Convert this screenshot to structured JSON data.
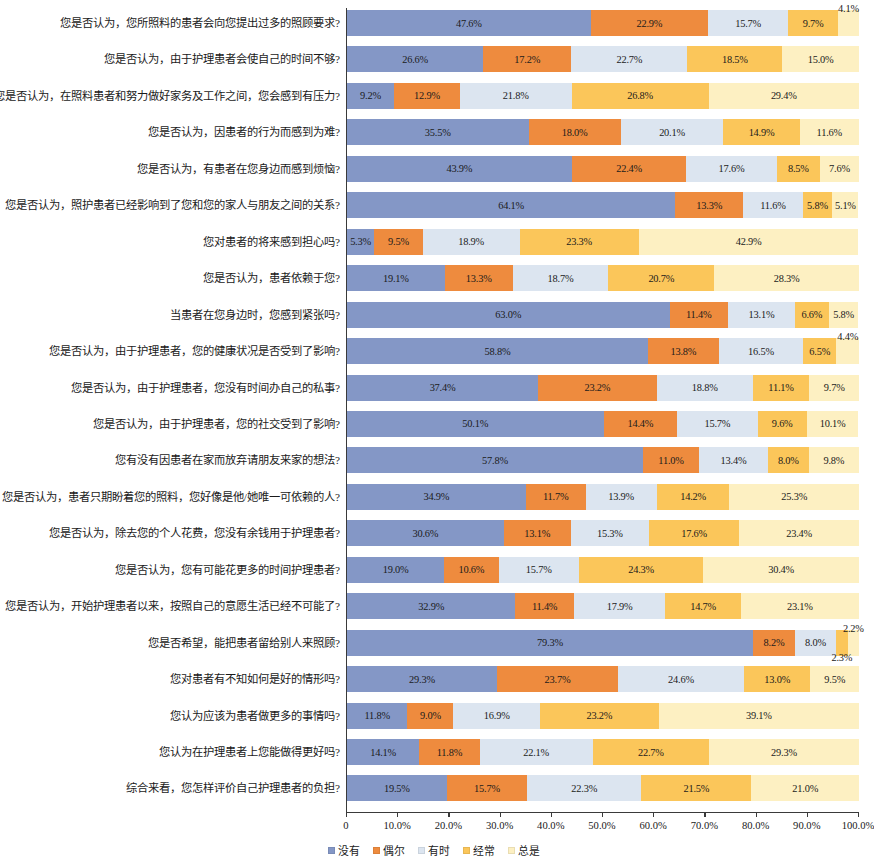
{
  "chart_data": {
    "type": "bar",
    "subtype": "horizontal-stacked-100-percent",
    "title": "",
    "subtitle": "",
    "xlabel": "",
    "ylabel": "",
    "xlim": [
      0,
      100
    ],
    "grid": false,
    "legend_position": "bottom",
    "value_suffix": "%",
    "x_ticks": [
      "0",
      "10.0%",
      "20.0%",
      "30.0%",
      "40.0%",
      "50.0%",
      "60.0%",
      "70.0%",
      "80.0%",
      "90.0%",
      "100.0%"
    ],
    "x_tick_values": [
      0,
      10,
      20,
      30,
      40,
      50,
      60,
      70,
      80,
      90,
      100
    ],
    "series_names": [
      "没有",
      "偶尔",
      "有时",
      "经常",
      "总是"
    ],
    "series_colors": [
      "#8497c6",
      "#ee8b3e",
      "#dce5f0",
      "#fbc65a",
      "#fdf0c2"
    ],
    "categories": [
      "您是否认为，您所照料的患者会向您提出过多的照顾要求?",
      "您是否认为，由于护理患者会使自己的时间不够?",
      "您是否认为，在照料患者和努力做好家务及工作之间，您会感到有压力?",
      "您是否认为，因患者的行为而感到为难?",
      "您是否认为，有患者在您身边而感到烦恼?",
      "您是否认为，照护患者已经影响到了您和您的家人与朋友之间的关系?",
      "您对患者的将来感到担心吗?",
      "您是否认为，患者依赖于您?",
      "当患者在您身边时，您感到紧张吗?",
      "您是否认为，由于护理患者，您的健康状况是否受到了影响?",
      "您是否认为，由于护理患者，您没有时间办自己的私事?",
      "您是否认为，由于护理患者，您的社交受到了影响?",
      "您有没有因患者在家而放弃请朋友来家的想法?",
      "您是否认为，患者只期盼着您的照料，您好像是他/她唯一可依赖的人?",
      "您是否认为，除去您的个人花费，您没有余钱用于护理患者?",
      "您是否认为，您有可能花更多的时间护理患者?",
      "您是否认为，开始护理患者以来，按照自己的意愿生活已经不可能了?",
      "您是否希望，能把患者留给别人来照顾?",
      "您对患者有不知如何是好的情形吗?",
      "您认为应该为患者做更多的事情吗?",
      "您认为在护理患者上您能做得更好吗?",
      "综合来看，您怎样评价自己护理患者的负担?"
    ],
    "series": [
      {
        "name": "没有",
        "color": "#8497c6",
        "values": [
          47.6,
          26.6,
          9.2,
          35.5,
          43.9,
          64.1,
          5.3,
          19.1,
          63.0,
          58.8,
          37.4,
          50.1,
          57.8,
          34.9,
          30.6,
          19.0,
          32.9,
          79.3,
          29.3,
          11.8,
          14.1,
          19.5
        ]
      },
      {
        "name": "偶尔",
        "color": "#ee8b3e",
        "values": [
          22.9,
          17.2,
          12.9,
          18.0,
          22.4,
          13.3,
          9.5,
          13.3,
          11.4,
          13.8,
          23.2,
          14.4,
          11.0,
          11.7,
          13.1,
          10.6,
          11.4,
          8.2,
          23.7,
          9.0,
          11.8,
          15.7
        ]
      },
      {
        "name": "有时",
        "color": "#dce5f0",
        "values": [
          15.7,
          22.7,
          21.8,
          20.1,
          17.6,
          11.6,
          18.9,
          18.7,
          13.1,
          16.5,
          18.8,
          15.7,
          13.4,
          13.9,
          15.3,
          15.7,
          17.9,
          8.0,
          24.6,
          16.9,
          22.1,
          22.3
        ]
      },
      {
        "name": "经常",
        "color": "#fbc65a",
        "values": [
          9.7,
          18.5,
          26.8,
          14.9,
          8.5,
          5.8,
          23.3,
          20.7,
          6.6,
          6.5,
          11.1,
          9.6,
          8.0,
          14.2,
          17.6,
          24.3,
          14.7,
          2.3,
          13.0,
          23.2,
          22.7,
          21.5
        ]
      },
      {
        "name": "总是",
        "color": "#fdf0c2",
        "values": [
          4.1,
          15.0,
          29.4,
          11.6,
          7.6,
          5.1,
          42.9,
          28.3,
          5.8,
          4.4,
          9.7,
          10.1,
          9.8,
          25.3,
          23.4,
          30.4,
          23.1,
          2.2,
          9.5,
          39.1,
          29.3,
          21.0
        ]
      }
    ],
    "data_labels": [
      [
        "47.6%",
        "22.9%",
        "15.7%",
        "9.7%",
        "4.1%"
      ],
      [
        "26.6%",
        "17.2%",
        "22.7%",
        "18.5%",
        "15.0%"
      ],
      [
        "9.2%",
        "12.9%",
        "21.8%",
        "26.8%",
        "29.4%"
      ],
      [
        "35.5%",
        "18.0%",
        "20.1%",
        "14.9%",
        "11.6%"
      ],
      [
        "43.9%",
        "22.4%",
        "17.6%",
        "8.5%",
        "7.6%"
      ],
      [
        "64.1%",
        "13.3%",
        "11.6%",
        "5.8%",
        "5.1%"
      ],
      [
        "5.3%",
        "9.5%",
        "18.9%",
        "23.3%",
        "42.9%"
      ],
      [
        "19.1%",
        "13.3%",
        "18.7%",
        "20.7%",
        "28.3%"
      ],
      [
        "63.0%",
        "11.4%",
        "13.1%",
        "6.6%",
        "5.8%"
      ],
      [
        "58.8%",
        "13.8%",
        "16.5%",
        "6.5%",
        "4.4%"
      ],
      [
        "37.4%",
        "23.2%",
        "18.8%",
        "11.1%",
        "9.7%"
      ],
      [
        "50.1%",
        "14.4%",
        "15.7%",
        "9.6%",
        "10.1%"
      ],
      [
        "57.8%",
        "11.0%",
        "13.4%",
        "8.0%",
        "9.8%"
      ],
      [
        "34.9%",
        "11.7%",
        "13.9%",
        "14.2%",
        "25.3%"
      ],
      [
        "30.6%",
        "13.1%",
        "15.3%",
        "17.6%",
        "23.4%"
      ],
      [
        "19.0%",
        "10.6%",
        "15.7%",
        "24.3%",
        "30.4%"
      ],
      [
        "32.9%",
        "11.4%",
        "17.9%",
        "14.7%",
        "23.1%"
      ],
      [
        "79.3%",
        "8.2%",
        "8.0%",
        "2.3%",
        "2.2%"
      ],
      [
        "29.3%",
        "23.7%",
        "24.6%",
        "13.0%",
        "9.5%"
      ],
      [
        "11.8%",
        "9.0%",
        "16.9%",
        "23.2%",
        "39.1%"
      ],
      [
        "14.1%",
        "11.8%",
        "22.1%",
        "22.7%",
        "29.3%"
      ],
      [
        "19.5%",
        "15.7%",
        "22.3%",
        "21.5%",
        "21.0%"
      ]
    ]
  },
  "legend": {
    "items": [
      {
        "label": "没有",
        "color": "#8497c6"
      },
      {
        "label": "偶尔",
        "color": "#ee8b3e"
      },
      {
        "label": "有时",
        "color": "#dce5f0"
      },
      {
        "label": "经常",
        "color": "#fbc65a"
      },
      {
        "label": "总是",
        "color": "#fdf0c2"
      }
    ]
  }
}
